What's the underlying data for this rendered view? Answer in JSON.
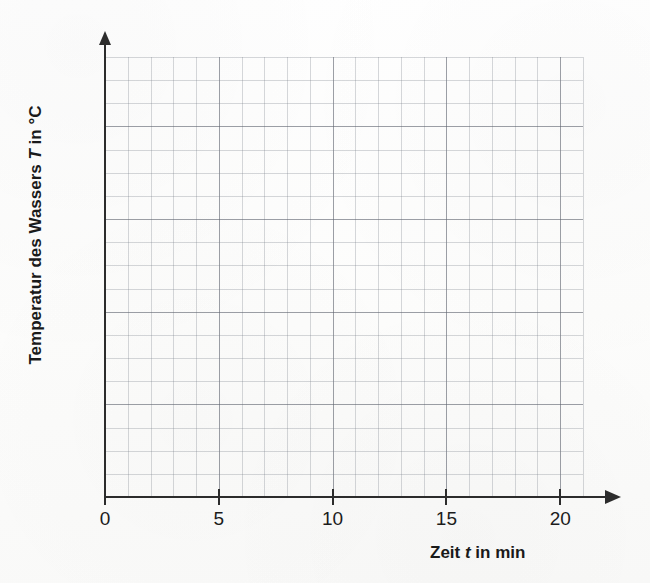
{
  "figure": {
    "kind": "blank-coordinate-grid",
    "background_color": "#fdfdfc",
    "axis_color": "#2c2c2c",
    "minor_grid_color": "#787d87",
    "major_grid_color": "#5f6470"
  },
  "axes": {
    "x": {
      "label_prefix": "Zeit ",
      "label_variable": "t",
      "label_suffix": " in min",
      "label_full": "Zeit t in min",
      "tick_labels": [
        "0",
        "5",
        "10",
        "15",
        "20"
      ],
      "tick_values": [
        0,
        5,
        10,
        15,
        20
      ],
      "unit": "min"
    },
    "y": {
      "label_prefix": "Temperatur des Wassers ",
      "label_variable": "T",
      "label_suffix": " in °C",
      "label_full": "Temperatur des Wassers T in °C",
      "tick_labels": [],
      "unit": "°C"
    }
  },
  "chart_data": {
    "type": "line",
    "title": "",
    "subtitle": "",
    "xlabel": "Zeit t in min",
    "ylabel": "Temperatur des Wassers T in °C",
    "x": [],
    "series": [],
    "xlim": [
      0,
      21
    ],
    "ylim": [
      0,
      19
    ],
    "xticks": [
      0,
      5,
      10,
      15,
      20
    ],
    "xticklabels": [
      "0",
      "5",
      "10",
      "15",
      "20"
    ],
    "yticks": [],
    "yticklabels": [],
    "grid": true,
    "grid_minor": true,
    "minor_cells_x": 21,
    "minor_cells_y": 19,
    "major_every_x": 5,
    "major_every_y": 4,
    "legend": null,
    "annotations": [],
    "note": "Empty grid provided for plotting measured water temperature over time; no data series drawn."
  }
}
